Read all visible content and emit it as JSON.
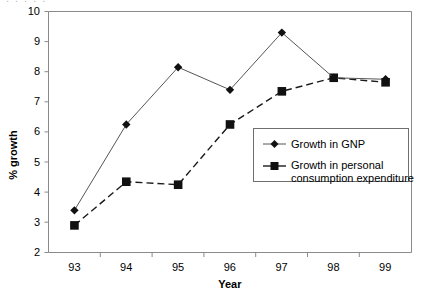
{
  "chart_data": {
    "type": "line",
    "title": "",
    "xlabel": "Year",
    "ylabel": "% growth",
    "categories": [
      "93",
      "94",
      "95",
      "96",
      "97",
      "98",
      "99"
    ],
    "ylim": [
      2,
      10
    ],
    "yticks": [
      2,
      3,
      4,
      5,
      6,
      7,
      8,
      9,
      10
    ],
    "grid": false,
    "legend_position": "center-right",
    "series": [
      {
        "name": "Growth in GNP",
        "marker": "diamond",
        "linestyle": "solid",
        "color": "#111111",
        "values": [
          3.4,
          6.25,
          8.15,
          7.4,
          9.3,
          7.8,
          7.75
        ]
      },
      {
        "name": "Growth in personal consumption expenditure",
        "marker": "square",
        "linestyle": "dashed",
        "color": "#111111",
        "values": [
          2.9,
          4.35,
          4.25,
          6.25,
          7.35,
          7.8,
          7.65
        ]
      }
    ]
  },
  "legend": {
    "entries": [
      {
        "label": "Growth in GNP"
      },
      {
        "label_line1": "Growth in personal",
        "label_line2": "consumption expenditure"
      }
    ]
  },
  "axes": {
    "y_title": "% growth",
    "x_title": "Year"
  },
  "artifact": {
    "top_clipped_text": "....."
  }
}
